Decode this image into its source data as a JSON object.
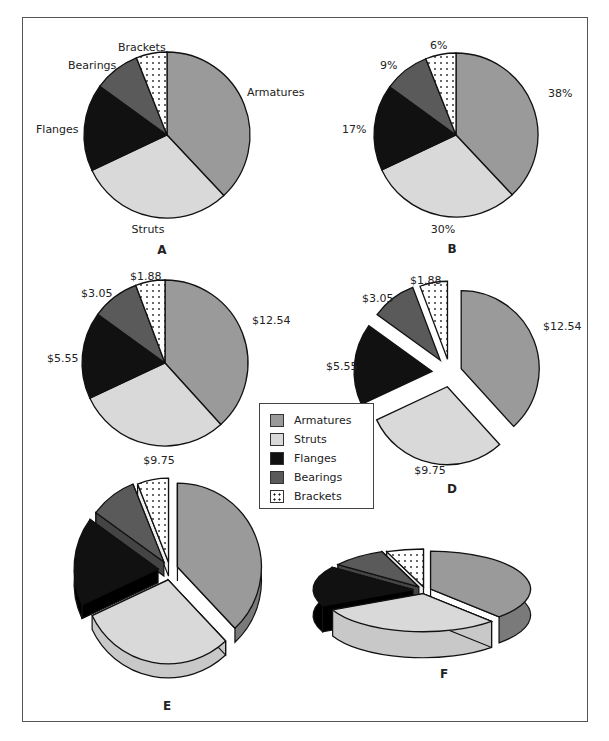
{
  "chart_data": [
    {
      "id": "A",
      "type": "pie",
      "caption": "A",
      "categories": [
        "Armatures",
        "Struts",
        "Flanges",
        "Bearings",
        "Brackets"
      ],
      "labels": [
        "Armatures",
        "Struts",
        "Flanges",
        "Bearings",
        "Brackets"
      ],
      "values": [
        38,
        30,
        17,
        9,
        6
      ],
      "style": "2d"
    },
    {
      "id": "B",
      "type": "pie",
      "caption": "B",
      "categories": [
        "Armatures",
        "Struts",
        "Flanges",
        "Bearings",
        "Brackets"
      ],
      "labels": [
        "38%",
        "30%",
        "17%",
        "9%",
        "6%"
      ],
      "values": [
        38,
        30,
        17,
        9,
        6
      ],
      "style": "2d"
    },
    {
      "id": "C",
      "type": "pie",
      "caption": "C",
      "categories": [
        "Armatures",
        "Struts",
        "Flanges",
        "Bearings",
        "Brackets"
      ],
      "labels": [
        "$12.54",
        "$9.75",
        "$5.55",
        "$3.05",
        "$1.88"
      ],
      "values": [
        12.54,
        9.75,
        5.55,
        3.05,
        1.88
      ],
      "style": "2d"
    },
    {
      "id": "D",
      "type": "pie",
      "caption": "D",
      "categories": [
        "Armatures",
        "Struts",
        "Flanges",
        "Bearings",
        "Brackets"
      ],
      "labels": [
        "$12.54",
        "$9.75",
        "$5.55",
        "$3.05",
        "$1.88"
      ],
      "values": [
        12.54,
        9.75,
        5.55,
        3.05,
        1.88
      ],
      "style": "2d-exploded"
    },
    {
      "id": "E",
      "type": "pie",
      "caption": "E",
      "categories": [
        "Armatures",
        "Struts",
        "Flanges",
        "Bearings",
        "Brackets"
      ],
      "values": [
        38,
        30,
        17,
        9,
        6
      ],
      "style": "3d-exploded-tilted"
    },
    {
      "id": "F",
      "type": "pie",
      "caption": "F",
      "categories": [
        "Armatures",
        "Struts",
        "Flanges",
        "Bearings",
        "Brackets"
      ],
      "values": [
        38,
        30,
        17,
        9,
        6
      ],
      "style": "3d-exploded-flat"
    }
  ],
  "legend": {
    "items": [
      {
        "label": "Armatures",
        "color": "#9a9a9a"
      },
      {
        "label": "Struts",
        "color": "#d9d9d9"
      },
      {
        "label": "Flanges",
        "color": "#111111"
      },
      {
        "label": "Bearings",
        "color": "#5a5a5a"
      },
      {
        "label": "Brackets",
        "color": "#ffffff",
        "pattern": "dots"
      }
    ]
  },
  "colors": {
    "armatures": "#9a9a9a",
    "armatures_side": "#7a7a7a",
    "struts": "#d9d9d9",
    "struts_side": "#c8c8c8",
    "flanges": "#111111",
    "flanges_side": "#000000",
    "bearings": "#5a5a5a",
    "bearings_side": "#444444",
    "brackets": "#ffffff"
  }
}
